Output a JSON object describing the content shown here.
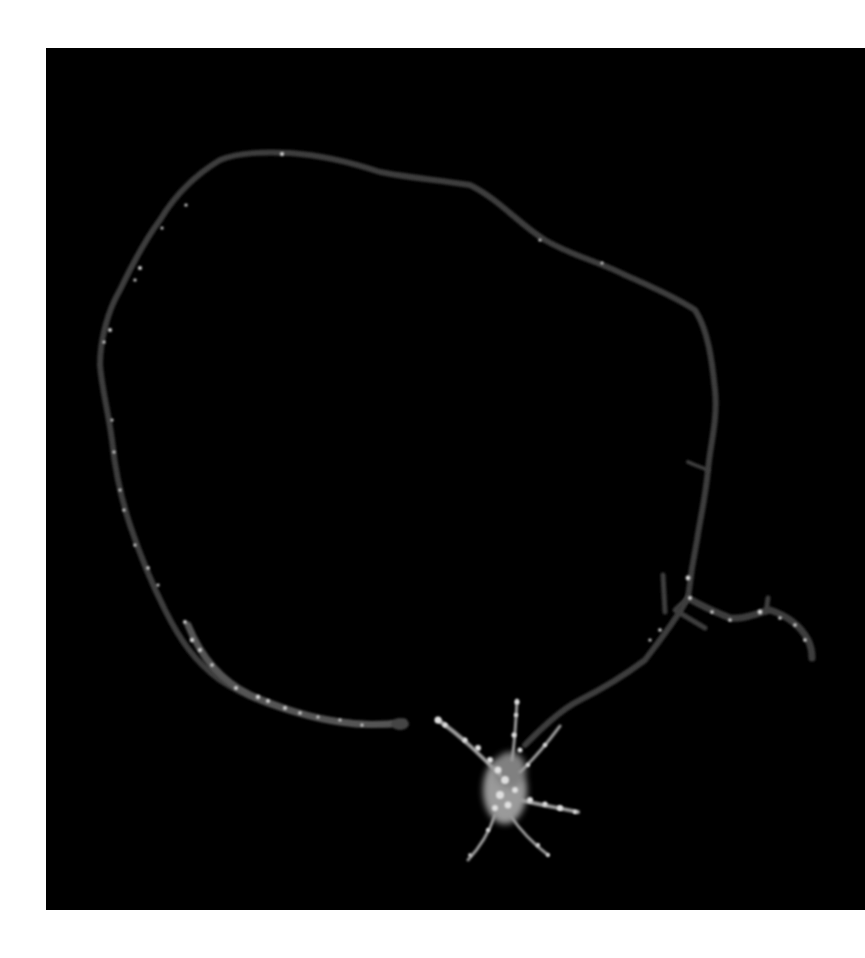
{
  "image": {
    "type": "fluorescence-microscopy",
    "subject": "single neuron with long looping neurite",
    "background_color": "#000000",
    "page_background": "#ffffff",
    "panel": {
      "x": 46,
      "y": 48,
      "width": 819,
      "height": 862
    },
    "colors": {
      "neurite": "#3a3a3a",
      "puncta": "#d8d8d8",
      "soma": "#bdbdbd"
    }
  }
}
